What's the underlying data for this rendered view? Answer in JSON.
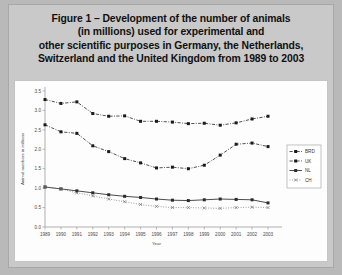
{
  "figure": {
    "title_lines": [
      "Figure 1 – Development of the number of animals",
      "(in millions) used for experimental and",
      "other scientific purposes in Germany, the Netherlands,",
      "Switzerland and the United Kingdom from 1989 to 2003"
    ]
  },
  "chart_data": {
    "type": "line",
    "title": "",
    "xlabel": "Year",
    "ylabel": "Animal numbers in millions",
    "categories": [
      "1989",
      "1990",
      "1991",
      "1992",
      "1993",
      "1994",
      "1995",
      "1996",
      "1997",
      "1998",
      "1999",
      "2000",
      "2001",
      "2002",
      "2003"
    ],
    "x": [
      1989,
      1990,
      1991,
      1992,
      1993,
      1994,
      1995,
      1996,
      1997,
      1998,
      1999,
      2000,
      2001,
      2002,
      2003
    ],
    "ylim": [
      0.0,
      3.5
    ],
    "yticks": [
      "0.0",
      "0.5",
      "1.0",
      "1.5",
      "2.0",
      "2.5",
      "3.0",
      "3.5"
    ],
    "ytick_values": [
      0.0,
      0.5,
      1.0,
      1.5,
      2.0,
      2.5,
      3.0,
      3.5
    ],
    "grid": false,
    "legend_position": "right",
    "series": [
      {
        "name": "BRD",
        "marker": "square",
        "line_style": "dash-dot",
        "color": "#1a1a1a",
        "values": [
          3.28,
          3.18,
          3.22,
          2.92,
          2.85,
          2.86,
          2.72,
          2.72,
          2.7,
          2.66,
          2.67,
          2.62,
          2.68,
          2.78,
          2.85
        ]
      },
      {
        "name": "UK",
        "marker": "square",
        "line_style": "dash-dot",
        "color": "#1a1a1a",
        "values": [
          2.63,
          2.45,
          2.41,
          2.09,
          1.94,
          1.76,
          1.65,
          1.52,
          1.54,
          1.5,
          1.59,
          1.85,
          2.13,
          2.16,
          2.07
        ]
      },
      {
        "name": "NL",
        "marker": "square",
        "line_style": "solid",
        "color": "#2a2a2a",
        "values": [
          1.03,
          0.98,
          0.93,
          0.88,
          0.83,
          0.79,
          0.76,
          0.72,
          0.69,
          0.68,
          0.7,
          0.72,
          0.71,
          0.7,
          0.62
        ]
      },
      {
        "name": "CH",
        "marker": "cross",
        "line_style": "dotted",
        "color": "#6e6e6e",
        "values": [
          1.03,
          0.98,
          0.88,
          0.8,
          0.72,
          0.65,
          0.58,
          0.53,
          0.5,
          0.5,
          0.49,
          0.48,
          0.5,
          0.51,
          0.5
        ]
      }
    ]
  }
}
